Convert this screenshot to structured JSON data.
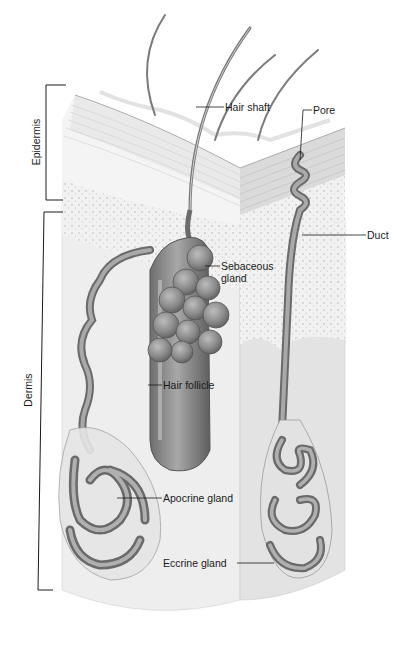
{
  "diagram": {
    "type": "anatomical-illustration",
    "brackets": [
      {
        "id": "epidermis",
        "label": "Epidermis"
      },
      {
        "id": "dermis",
        "label": "Dermis"
      }
    ],
    "callouts": [
      {
        "id": "hair-shaft",
        "label": "Hair shaft"
      },
      {
        "id": "pore",
        "label": "Pore"
      },
      {
        "id": "duct",
        "label": "Duct"
      },
      {
        "id": "sebaceous-gland",
        "label": "Sebaceous gland",
        "line1": "Sebaceous",
        "line2": "gland"
      },
      {
        "id": "hair-follicle",
        "label": "Hair follicle"
      },
      {
        "id": "apocrine-gland",
        "label": "Apocrine gland"
      },
      {
        "id": "eccrine-gland",
        "label": "Eccrine gland"
      }
    ],
    "colors": {
      "background": "#ffffff",
      "ink": "#1a1a1a",
      "tissue_light": "#ececec",
      "tissue_mid": "#d6d6d6",
      "structure_fill": "#8c8c8c",
      "structure_dark": "#5a5a5a"
    }
  }
}
